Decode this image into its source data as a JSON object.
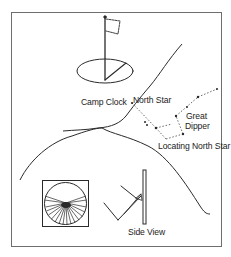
{
  "figure": {
    "labels": {
      "camp_clock": "Camp Clock",
      "north_star": "North Star",
      "great": "Great",
      "dipper": "Dipper",
      "locating_north_star": "Locating North Star",
      "side_view": "Side View"
    },
    "colors": {
      "ink": "#2a2a2a",
      "border": "#6e6e6e",
      "background": "#ffffff"
    }
  }
}
